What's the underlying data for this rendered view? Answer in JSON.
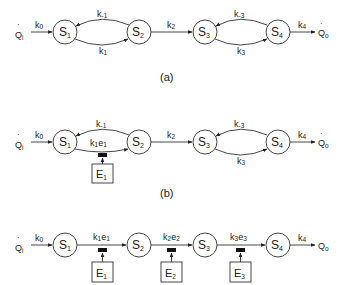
{
  "diagram": {
    "colors": {
      "line": "#333333",
      "text": "#222222",
      "background": "#ffffff",
      "effector": "#111111"
    },
    "panels": [
      {
        "id": "a",
        "caption": "(a)",
        "input": {
          "label": "Q",
          "sub": "i",
          "rate": "k",
          "rate_sub": "0"
        },
        "output": {
          "label": "Q",
          "sub": "o",
          "rate": "k",
          "rate_sub": "4"
        },
        "nodes": [
          {
            "label": "S",
            "sub": "1"
          },
          {
            "label": "S",
            "sub": "2"
          },
          {
            "label": "S",
            "sub": "3"
          },
          {
            "label": "S",
            "sub": "4"
          }
        ],
        "edges": [
          {
            "from": "S1",
            "to": "S2",
            "label": "k",
            "sub": "1",
            "position": "lower"
          },
          {
            "from": "S2",
            "to": "S1",
            "label": "k",
            "sub": "-1",
            "position": "upper"
          },
          {
            "from": "S2",
            "to": "S3",
            "label": "k",
            "sub": "2",
            "position": "straight"
          },
          {
            "from": "S3",
            "to": "S4",
            "label": "k",
            "sub": "3",
            "position": "lower"
          },
          {
            "from": "S4",
            "to": "S3",
            "label": "k",
            "sub": "-3",
            "position": "upper"
          }
        ]
      },
      {
        "id": "b",
        "caption": "(b)",
        "input": {
          "label": "Q",
          "sub": "i",
          "rate": "k",
          "rate_sub": "0"
        },
        "output": {
          "label": "Q",
          "sub": "o",
          "rate": "k",
          "rate_sub": "4"
        },
        "nodes": [
          {
            "label": "S",
            "sub": "1"
          },
          {
            "label": "S",
            "sub": "2"
          },
          {
            "label": "S",
            "sub": "3"
          },
          {
            "label": "S",
            "sub": "4"
          }
        ],
        "edges": [
          {
            "from": "S1",
            "to": "S2",
            "label": "k",
            "sub": "1",
            "label2": "e",
            "sub2": "1",
            "position": "lower",
            "enzyme": "E1"
          },
          {
            "from": "S2",
            "to": "S1",
            "label": "k",
            "sub": "-1",
            "position": "upper"
          },
          {
            "from": "S2",
            "to": "S3",
            "label": "k",
            "sub": "2",
            "position": "straight"
          },
          {
            "from": "S3",
            "to": "S4",
            "label": "k",
            "sub": "3",
            "position": "lower"
          },
          {
            "from": "S4",
            "to": "S3",
            "label": "k",
            "sub": "-3",
            "position": "upper"
          }
        ],
        "enzymes": [
          {
            "label": "E",
            "sub": "1"
          }
        ]
      },
      {
        "id": "c",
        "caption": "",
        "input": {
          "label": "Q",
          "sub": "i",
          "rate": "k",
          "rate_sub": "0"
        },
        "output": {
          "label": "Q",
          "sub": "o",
          "rate": "k",
          "rate_sub": "4"
        },
        "nodes": [
          {
            "label": "S",
            "sub": "1"
          },
          {
            "label": "S",
            "sub": "2"
          },
          {
            "label": "S",
            "sub": "3"
          },
          {
            "label": "S",
            "sub": "4"
          }
        ],
        "edges": [
          {
            "from": "S1",
            "to": "S2",
            "label": "k",
            "sub": "1",
            "label2": "e",
            "sub2": "1",
            "enzyme": "E1"
          },
          {
            "from": "S2",
            "to": "S3",
            "label": "k",
            "sub": "2",
            "label2": "e",
            "sub2": "2",
            "enzyme": "E2"
          },
          {
            "from": "S3",
            "to": "S4",
            "label": "k",
            "sub": "3",
            "label2": "e",
            "sub2": "3",
            "enzyme": "E3"
          }
        ],
        "enzymes": [
          {
            "label": "E",
            "sub": "1"
          },
          {
            "label": "E",
            "sub": "2"
          },
          {
            "label": "E",
            "sub": "3"
          }
        ]
      }
    ]
  }
}
